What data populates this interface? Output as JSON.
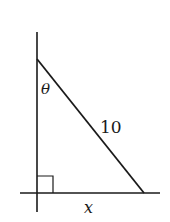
{
  "diagram": {
    "type": "right-triangle",
    "labels": {
      "angle": "θ",
      "hypotenuse": "10",
      "base": "x"
    },
    "colors": {
      "stroke": "#1a1a1a",
      "background": "#ffffff"
    },
    "geometry": {
      "vertical_axis": {
        "x": 37,
        "y1": 32,
        "y2": 212
      },
      "horizontal_axis": {
        "y": 193,
        "x1": 20,
        "x2": 160
      },
      "top_vertex": {
        "x": 37,
        "y": 59
      },
      "right_vertex": {
        "x": 144,
        "y": 193
      },
      "right_angle_vertex": {
        "x": 37,
        "y": 193
      },
      "right_angle_marker_size": 16
    }
  }
}
